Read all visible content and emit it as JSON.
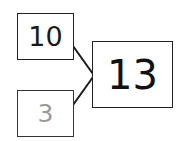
{
  "diagram": {
    "type": "number-bond",
    "parts": [
      {
        "value": "10",
        "color": "#1a1a1a"
      },
      {
        "value": "3",
        "color": "#9a9a9a"
      }
    ],
    "whole": {
      "value": "13",
      "color": "#111111"
    },
    "line_color": "#1a1a1a"
  }
}
